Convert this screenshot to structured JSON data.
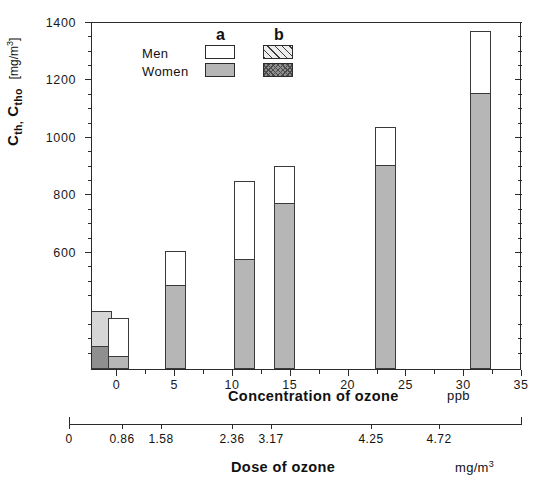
{
  "chart_data": {
    "type": "bar",
    "title": "",
    "subtitle": "",
    "ylabel": "C_th, C_tho",
    "yunit": "[mg/m3]",
    "ylabel_main": "C",
    "ylabel_sub1": "th,",
    "ylabel_main2": "C",
    "ylabel_sub2": "tho",
    "ylim": [
      193,
      1400
    ],
    "yticks": [
      600,
      800,
      1000,
      1200,
      1400
    ],
    "ytick_labels": [
      "600",
      "800",
      "1000",
      "1200",
      "1400"
    ],
    "yminor_step": 50,
    "grid": false,
    "xlabel": "Concentration of ozone",
    "xunit": "ppb",
    "xlim": [
      -2.2,
      35
    ],
    "xticks": [
      0,
      5,
      10,
      15,
      20,
      25,
      30,
      35
    ],
    "xtick_labels": [
      "0",
      "5",
      "10",
      "15",
      "20",
      "25",
      "30",
      "35"
    ],
    "secondary_xlabel": "Dose of ozone",
    "secondary_xunit": "mg/m3",
    "secondary_xticks": [
      0,
      0.86,
      1.58,
      2.36,
      3.17,
      4.25,
      4.72
    ],
    "secondary_xtick_labels": [
      "0",
      "0.86",
      "1.58",
      "2.36",
      "3.17",
      "4.25",
      "4.72"
    ],
    "legend_position": "upper-left-inside",
    "legend_columns": [
      "a",
      "b"
    ],
    "legend_rows": [
      "Men",
      "Women"
    ],
    "series": [
      {
        "name": "Men a",
        "style": "white"
      },
      {
        "name": "Men b",
        "style": "hatched"
      },
      {
        "name": "Women a",
        "style": "light-grey"
      },
      {
        "name": "Women b",
        "style": "dark-grey"
      }
    ],
    "bars": [
      {
        "label": "0 b",
        "group": "b",
        "x": -1.25,
        "women": 275,
        "men_top": 395
      },
      {
        "label": "0 a",
        "group": "a",
        "x": 0.15,
        "women": 240,
        "men_top": 370
      },
      {
        "label": "5 a",
        "group": "a",
        "x": 5.15,
        "women": 490,
        "men_top": 605
      },
      {
        "label": "10 a",
        "group": "a",
        "x": 11.1,
        "women": 578,
        "men_top": 848
      },
      {
        "label": "15 a",
        "group": "a",
        "x": 14.5,
        "women": 775,
        "men_top": 900
      },
      {
        "label": "23 a",
        "group": "a",
        "x": 23.3,
        "women": 905,
        "men_top": 1035
      },
      {
        "label": "31 a",
        "group": "a",
        "x": 31.5,
        "women": 1157,
        "men_top": 1370
      }
    ]
  },
  "axes": {
    "y": {
      "ticks": [
        {
          "value": 1400,
          "label": "1400"
        },
        {
          "value": 1200,
          "label": "1200"
        },
        {
          "value": 1000,
          "label": "1000"
        },
        {
          "value": 800,
          "label": "800"
        },
        {
          "value": 600,
          "label": "600"
        }
      ]
    },
    "x_primary": {
      "title": "Concentration of ozone",
      "unit": "ppb",
      "ticks": [
        {
          "value": 0,
          "label": "0"
        },
        {
          "value": 5,
          "label": "5"
        },
        {
          "value": 10,
          "label": "10"
        },
        {
          "value": 15,
          "label": "15"
        },
        {
          "value": 20,
          "label": "20"
        },
        {
          "value": 25,
          "label": "25"
        },
        {
          "value": 30,
          "label": "30"
        },
        {
          "value": 35,
          "label": "35"
        }
      ]
    },
    "x_secondary": {
      "title": "Dose of ozone",
      "unit_prefix": "mg/m",
      "unit_sup": "3",
      "ticks": [
        {
          "pos": 0,
          "label": "0"
        },
        {
          "pos": 0.86,
          "label": "0.86"
        },
        {
          "pos": 1.58,
          "label": "1.58"
        },
        {
          "pos": 2.36,
          "label": "2.36"
        },
        {
          "pos": 3.17,
          "label": "3.17"
        },
        {
          "pos": 4.25,
          "label": "4.25"
        },
        {
          "pos": 4.72,
          "label": "4.72"
        }
      ]
    }
  },
  "legend": {
    "col_a": "a",
    "col_b": "b",
    "row_men": "Men",
    "row_women": "Women"
  },
  "ytitle": {
    "c1": "C",
    "sub1": "th,",
    "c2": "C",
    "sub2": "tho",
    "unit_open": "[mg/m",
    "unit_sup": "3",
    "unit_close": "]"
  },
  "colors": {
    "axis": "#2b2b2b",
    "men_a": "#ffffff",
    "women_a": "#b6b6b6",
    "men_b_hatch": "#d6d6d6",
    "women_b": "#8f8f8f",
    "background": "#ffffff"
  }
}
